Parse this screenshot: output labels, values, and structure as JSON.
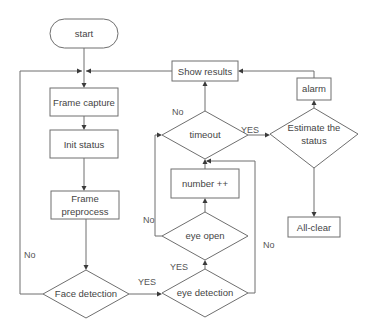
{
  "diagram": {
    "type": "flowchart",
    "nodes": {
      "start": {
        "label": "start",
        "shape": "terminal"
      },
      "frame_capture": {
        "label": "Frame capture",
        "shape": "process"
      },
      "init_status": {
        "label": "Init status",
        "shape": "process"
      },
      "frame_preprocess": {
        "line1": "Frame",
        "line2": "preprocess",
        "shape": "process"
      },
      "face_detection": {
        "label": "Face detection",
        "shape": "decision"
      },
      "eye_detection": {
        "label": "eye detection",
        "shape": "decision"
      },
      "eye_open": {
        "label": "eye open",
        "shape": "decision"
      },
      "number_inc": {
        "label": "number ++",
        "shape": "process"
      },
      "timeout": {
        "label": "timeout",
        "shape": "decision"
      },
      "estimate_status": {
        "line1": "Estimate the",
        "line2": "status",
        "shape": "decision"
      },
      "alarm": {
        "label": "alarm",
        "shape": "process"
      },
      "all_clear": {
        "label": "All-clear",
        "shape": "process"
      },
      "show_results": {
        "label": "Show results",
        "shape": "process"
      }
    },
    "edge_labels": {
      "face_no": "No",
      "face_yes": "YES",
      "eye_detection_yes": "YES",
      "eye_detection_no": "No",
      "eye_open_no": "No",
      "timeout_no": "No",
      "timeout_yes": "YES"
    },
    "edges": [
      {
        "from": "start",
        "to": "frame_capture"
      },
      {
        "from": "frame_capture",
        "to": "init_status"
      },
      {
        "from": "init_status",
        "to": "frame_preprocess"
      },
      {
        "from": "frame_preprocess",
        "to": "face_detection"
      },
      {
        "from": "face_detection",
        "to": "frame_capture",
        "label": "No"
      },
      {
        "from": "face_detection",
        "to": "eye_detection",
        "label": "YES"
      },
      {
        "from": "eye_detection",
        "to": "eye_open",
        "label": "YES"
      },
      {
        "from": "eye_detection",
        "to": "timeout",
        "label": "No"
      },
      {
        "from": "eye_open",
        "to": "number_inc"
      },
      {
        "from": "eye_open",
        "to": "timeout",
        "label": "No"
      },
      {
        "from": "number_inc",
        "to": "timeout"
      },
      {
        "from": "timeout",
        "to": "show_results",
        "label": "No"
      },
      {
        "from": "timeout",
        "to": "estimate_status",
        "label": "YES"
      },
      {
        "from": "estimate_status",
        "to": "alarm"
      },
      {
        "from": "estimate_status",
        "to": "all_clear"
      },
      {
        "from": "alarm",
        "to": "show_results"
      },
      {
        "from": "show_results",
        "to": "frame_capture"
      }
    ]
  }
}
